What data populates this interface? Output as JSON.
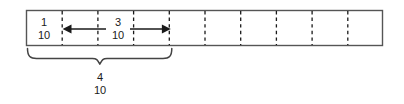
{
  "diagram": {
    "type": "fraction-bar",
    "total_parts": 10,
    "bar": {
      "x": 26,
      "y": 10,
      "width": 357,
      "height": 36,
      "stroke_color": "#555555",
      "fill_color": "#ffffff",
      "divider_color": "#1a1a1a",
      "divider_count": 9
    },
    "labels": {
      "first_part": {
        "numerator": "1",
        "denominator": "10",
        "center_x": 44,
        "center_y": 28
      },
      "arrow_span": {
        "numerator": "3",
        "denominator": "10",
        "center_x": 118,
        "center_y": 28
      },
      "brace_total": {
        "numerator": "4",
        "denominator": "10",
        "center_x": 100,
        "center_y": 84
      }
    },
    "arrows": {
      "color": "#1a1a1a",
      "left_arrow": {
        "from_x": 105,
        "to_x": 64,
        "y": 29,
        "direction": "left"
      },
      "right_arrow": {
        "from_x": 131,
        "to_x": 172,
        "y": 29,
        "direction": "right"
      }
    },
    "brace": {
      "color": "#444444",
      "left_x": 27,
      "right_x": 172,
      "top_y": 48,
      "point_x": 100,
      "point_y": 64
    }
  }
}
